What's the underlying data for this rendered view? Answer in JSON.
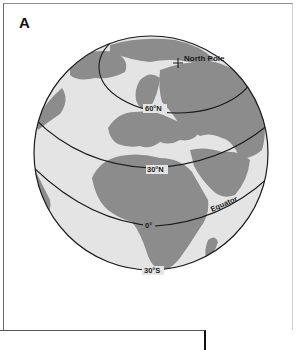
{
  "figure": {
    "panel_label": "A",
    "labels": {
      "north_pole": "North Pole",
      "lat_60n": "60°N",
      "lat_30n": "30°N",
      "lat_0": "0°",
      "equator": "Equator",
      "lat_30s": "30°S"
    },
    "colors": {
      "ocean": "#e4e4e4",
      "land": "#8c8c8c",
      "lines": "#1a1a1a",
      "background": "#ffffff"
    }
  }
}
